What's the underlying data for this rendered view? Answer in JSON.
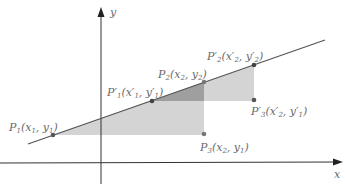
{
  "axes": {
    "x_label": "x",
    "y_label": "y"
  },
  "colors": {
    "axis": "#333333",
    "line": "#555555",
    "light_shade": "#d4d4d4",
    "dark_shade": "#9f9f9f",
    "point": "#555555",
    "label": "#6a6a6a"
  },
  "points": {
    "P1": {
      "name": "P",
      "sub": "1",
      "coords": "(x",
      "coords_sub1": "1",
      "mid": ", y",
      "coords_sub2": "1",
      "end": ")"
    },
    "P1p": {
      "name": "P′",
      "sub": "1",
      "coords": "(x′",
      "coords_sub1": "1",
      "mid": ", y′",
      "coords_sub2": "1",
      "end": ")"
    },
    "P2": {
      "name": "P",
      "sub": "2",
      "coords": "(x",
      "coords_sub1": "2",
      "mid": ", y",
      "coords_sub2": "2",
      "end": ")"
    },
    "P2p": {
      "name": "P′",
      "sub": "2",
      "coords": "(x′",
      "coords_sub1": "2",
      "mid": ", y′",
      "coords_sub2": "2",
      "end": ")"
    },
    "P3": {
      "name": "P",
      "sub": "3",
      "coords": "(x",
      "coords_sub1": "2",
      "mid": ", y",
      "coords_sub2": "1",
      "end": ")"
    },
    "P3p": {
      "name": "P′",
      "sub": "3",
      "coords": "(x′",
      "coords_sub1": "2",
      "mid": ", y′",
      "coords_sub2": "1",
      "end": ")"
    }
  }
}
